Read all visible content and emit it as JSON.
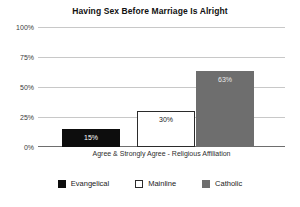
{
  "chart_data": {
    "type": "bar",
    "title": "Having Sex Before Marriage Is Alright",
    "xlabel": "Agree & Strongly Agree - Religious Affiliation",
    "ylabel": "",
    "categories": [
      "Evangelical",
      "Mainline",
      "Catholic"
    ],
    "values": [
      15,
      30,
      63
    ],
    "value_labels": [
      "15%",
      "30%",
      "63%"
    ],
    "ylim": [
      0,
      100
    ],
    "yticks": [
      0,
      25,
      50,
      75,
      100
    ],
    "ytick_labels": [
      "0%",
      "25%",
      "50%",
      "75%",
      "100%"
    ],
    "grid": true,
    "legend_position": "bottom",
    "series": [
      {
        "name": "Evangelical",
        "value": 15,
        "label": "15%",
        "color": "#0d0d0d"
      },
      {
        "name": "Mainline",
        "value": 30,
        "label": "30%",
        "color": "#ffffff"
      },
      {
        "name": "Catholic",
        "value": 63,
        "label": "63%",
        "color": "#6e6e6e"
      }
    ]
  },
  "legend": {
    "items": [
      {
        "label": "Evangelical",
        "swatch": "legend-swatch-black"
      },
      {
        "label": "Mainline",
        "swatch": "legend-swatch-white"
      },
      {
        "label": "Catholic",
        "swatch": "legend-swatch-gray"
      }
    ]
  },
  "colors": {
    "evangelical": "#0d0d0d",
    "mainline": "#ffffff",
    "catholic": "#6e6e6e",
    "gridline": "#c8c8c8",
    "axis": "#6e6e6e",
    "background": "#ffffff"
  }
}
